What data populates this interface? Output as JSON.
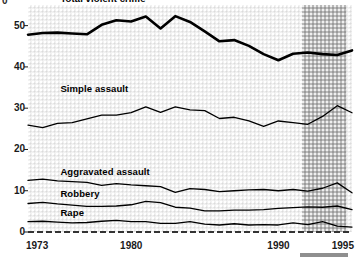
{
  "chart_data": {
    "type": "line",
    "title": "",
    "subtitle": "",
    "xlabel": "",
    "ylabel": "",
    "unit_glyph": "0",
    "x": [
      1973,
      1974,
      1975,
      1976,
      1977,
      1978,
      1979,
      1980,
      1981,
      1982,
      1983,
      1984,
      1985,
      1986,
      1987,
      1988,
      1989,
      1990,
      1991,
      1992,
      1993,
      1994,
      1995
    ],
    "xlim": [
      1973,
      1995
    ],
    "ylim": [
      0,
      55
    ],
    "xticks": [
      1973,
      1980,
      1990,
      1995
    ],
    "xtick_labels": [
      "1973",
      "1980",
      "1990",
      "1995"
    ],
    "yticks": [
      0,
      10,
      20,
      30,
      40,
      50
    ],
    "ytick_labels": [
      "0",
      "10",
      "20",
      "30",
      "40",
      "50"
    ],
    "grid": false,
    "legend": "inline-labels",
    "highlight_band": {
      "label": "",
      "x_start": 1991.6,
      "x_end": 1994.6,
      "color": "#b9b9b9"
    },
    "baseline": {
      "value": 0,
      "style": "dashed",
      "color": "#333333"
    },
    "series": [
      {
        "name": "Total violent crime",
        "label": "Total violent crime",
        "style": "thick",
        "color": "#000000",
        "label_x": 1975.2,
        "label_y": 56.5,
        "values": [
          47.8,
          48.2,
          48.3,
          48.1,
          47.9,
          50.2,
          51.3,
          51.0,
          52.2,
          49.3,
          52.3,
          50.9,
          48.6,
          46.2,
          46.5,
          45.1,
          43.1,
          41.6,
          43.2,
          43.5,
          43.1,
          42.9,
          44.0
        ]
      },
      {
        "name": "Simple assault",
        "label": "Simple assault",
        "style": "thin",
        "color": "#000000",
        "label_x": 1975.2,
        "label_y": 34.6,
        "values": [
          25.9,
          25.3,
          26.3,
          26.5,
          27.4,
          28.3,
          28.3,
          28.9,
          30.3,
          29.0,
          30.3,
          29.6,
          29.4,
          27.5,
          27.8,
          26.9,
          25.6,
          26.9,
          26.5,
          26.1,
          28.0,
          30.6,
          28.9
        ]
      },
      {
        "name": "Aggravated assault",
        "label": "Aggravated assault",
        "style": "thin",
        "color": "#000000",
        "label_x": 1975.2,
        "label_y": 14.6,
        "values": [
          12.5,
          12.8,
          12.4,
          12.2,
          12.0,
          11.3,
          11.7,
          11.4,
          11.2,
          11.0,
          9.6,
          10.5,
          10.3,
          9.8,
          10.0,
          10.2,
          10.3,
          10.0,
          10.3,
          9.9,
          10.6,
          11.9,
          9.5
        ]
      },
      {
        "name": "Robbery",
        "label": "Robbery",
        "style": "thin",
        "color": "#000000",
        "label_x": 1975.2,
        "label_y": 9.3,
        "values": [
          6.9,
          7.2,
          6.8,
          6.5,
          6.2,
          6.2,
          6.3,
          6.6,
          7.4,
          7.1,
          6.0,
          5.8,
          5.1,
          5.1,
          5.3,
          5.3,
          5.4,
          5.7,
          5.9,
          6.1,
          6.0,
          6.3,
          5.4
        ]
      },
      {
        "name": "Rape",
        "label": "Rape",
        "style": "thin",
        "color": "#000000",
        "label_x": 1975.2,
        "label_y": 4.6,
        "values": [
          2.5,
          2.6,
          2.4,
          2.2,
          2.3,
          2.6,
          2.8,
          2.5,
          2.5,
          2.1,
          2.1,
          2.5,
          1.9,
          1.7,
          2.0,
          1.7,
          1.8,
          1.7,
          2.2,
          1.8,
          2.5,
          1.4,
          1.2
        ]
      }
    ]
  }
}
